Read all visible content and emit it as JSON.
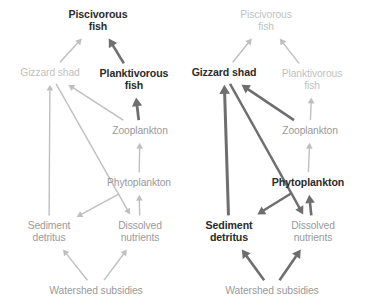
{
  "figure": {
    "type": "diagram",
    "background_color": "#ffffff",
    "panel_count": 2,
    "colors": {
      "faint_gray": "#bfbfbf",
      "mid_gray": "#9a9a9a",
      "dark_gray": "#6e6e6e",
      "near_black": "#2b2b2b"
    },
    "emphasis_legend": {
      "faint": "de-emphasized / inactive pathway",
      "mid": "secondary pathway",
      "dark": "emphasized / dominant pathway"
    }
  },
  "panels": [
    {
      "id": "left",
      "name": "panel-left",
      "emphasis": "planktivory pathway",
      "nodes": [
        {
          "id": "pisc",
          "label": "Piscivorous\nfish",
          "tone": "dark",
          "x": 98,
          "y": 21
        },
        {
          "id": "gizz",
          "label": "Gizzard shad",
          "tone": "faint",
          "x": 50,
          "y": 73
        },
        {
          "id": "plank",
          "label": "Planktivorous\nfish",
          "tone": "dark",
          "x": 134,
          "y": 80
        },
        {
          "id": "zoo",
          "label": "Zooplankton",
          "tone": "mid",
          "x": 140,
          "y": 131
        },
        {
          "id": "phyto",
          "label": "Phytoplankton",
          "tone": "mid",
          "x": 139,
          "y": 183
        },
        {
          "id": "sed",
          "label": "Sediment\ndetritus",
          "tone": "mid",
          "x": 49,
          "y": 232
        },
        {
          "id": "diss",
          "label": "Dissolved\nnutrients",
          "tone": "mid",
          "x": 140,
          "y": 232
        },
        {
          "id": "wat",
          "label": "Watershed subsidies",
          "tone": "mid",
          "x": 96,
          "y": 291
        }
      ],
      "edges": [
        {
          "from": "gizz",
          "to": "pisc",
          "tone": "faint",
          "width": 1.5
        },
        {
          "from": "plank",
          "to": "pisc",
          "tone": "dark",
          "width": 2.6
        },
        {
          "from": "zoo",
          "to": "plank",
          "tone": "dark",
          "width": 2.8
        },
        {
          "from": "zoo",
          "to": "gizz",
          "tone": "faint",
          "width": 1.5
        },
        {
          "from": "sed",
          "to": "gizz",
          "tone": "faint",
          "width": 1.4
        },
        {
          "from": "phyto",
          "to": "zoo",
          "tone": "faint",
          "width": 1.4
        },
        {
          "from": "diss",
          "to": "phyto",
          "tone": "faint",
          "width": 1.4
        },
        {
          "from": "gizz",
          "to": "diss",
          "tone": "faint",
          "width": 1.4
        },
        {
          "from": "phyto",
          "to": "sed",
          "tone": "faint",
          "width": 1.4
        },
        {
          "from": "wat",
          "to": "sed",
          "tone": "faint",
          "width": 1.4
        },
        {
          "from": "wat",
          "to": "diss",
          "tone": "faint",
          "width": 1.4
        }
      ]
    },
    {
      "id": "right",
      "name": "panel-right",
      "emphasis": "detritivory pathway",
      "nodes": [
        {
          "id": "pisc",
          "label": "Piscivorous\nfish",
          "tone": "faint",
          "x": 266,
          "y": 21
        },
        {
          "id": "gizz",
          "label": "Gizzard shad",
          "tone": "dark",
          "x": 224,
          "y": 73
        },
        {
          "id": "plank",
          "label": "Planktivorous\nfish",
          "tone": "faint",
          "x": 312,
          "y": 80
        },
        {
          "id": "zoo",
          "label": "Zooplankton",
          "tone": "mid",
          "x": 310,
          "y": 131
        },
        {
          "id": "phyto",
          "label": "Phytoplankton",
          "tone": "dark",
          "x": 308,
          "y": 183
        },
        {
          "id": "sed",
          "label": "Sediment\ndetritus",
          "tone": "dark",
          "x": 229,
          "y": 232
        },
        {
          "id": "diss",
          "label": "Dissolved\nnutrients",
          "tone": "mid",
          "x": 313,
          "y": 232
        },
        {
          "id": "wat",
          "label": "Watershed subsidies",
          "tone": "mid",
          "x": 272,
          "y": 291
        }
      ],
      "edges": [
        {
          "from": "gizz",
          "to": "pisc",
          "tone": "faint",
          "width": 1.5
        },
        {
          "from": "plank",
          "to": "pisc",
          "tone": "faint",
          "width": 1.5
        },
        {
          "from": "zoo",
          "to": "plank",
          "tone": "faint",
          "width": 1.4
        },
        {
          "from": "zoo",
          "to": "gizz",
          "tone": "dark",
          "width": 2.6
        },
        {
          "from": "sed",
          "to": "gizz",
          "tone": "dark",
          "width": 3.0
        },
        {
          "from": "phyto",
          "to": "zoo",
          "tone": "faint",
          "width": 1.4
        },
        {
          "from": "diss",
          "to": "phyto",
          "tone": "dark",
          "width": 2.6
        },
        {
          "from": "gizz",
          "to": "diss",
          "tone": "dark",
          "width": 2.4
        },
        {
          "from": "phyto",
          "to": "sed",
          "tone": "dark",
          "width": 2.4
        },
        {
          "from": "wat",
          "to": "sed",
          "tone": "dark",
          "width": 2.6
        },
        {
          "from": "wat",
          "to": "diss",
          "tone": "dark",
          "width": 2.6
        }
      ]
    }
  ]
}
